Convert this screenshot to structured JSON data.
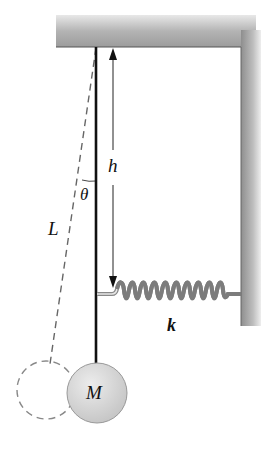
{
  "diagram": {
    "type": "pendulum-spring-system",
    "labels": {
      "height": "h",
      "angle": "θ",
      "length": "L",
      "spring_constant": "k",
      "mass": "M"
    },
    "colors": {
      "support": "#a8a8a8",
      "support_dark": "#8c8c8c",
      "rod": "#111111",
      "mass_fill": "#d6d6d6",
      "dashed": "#777777",
      "spring": "#8a8a8a"
    }
  }
}
